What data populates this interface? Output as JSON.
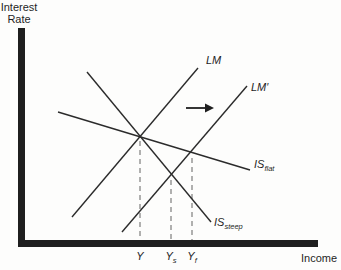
{
  "figure": {
    "background": "#fdfdfc",
    "ink_color": "#1f1f1f",
    "curve_color": "#2b2b2b",
    "guide_color": "#8f8f8f"
  },
  "labels": {
    "y_axis_line1": "Interest",
    "y_axis_line2": "Rate",
    "x_axis": "Income",
    "lm": "LM",
    "lm_prime": "LM′",
    "is_flat_main": "IS",
    "is_flat_sub": "flat",
    "is_steep_main": "IS",
    "is_steep_sub": "steep",
    "tick_y_main": "Y",
    "tick_y_sub": "",
    "tick_ys_main": "Y",
    "tick_ys_sub": "s",
    "tick_yf_main": "Y",
    "tick_yf_sub": "f"
  },
  "chart_data": {
    "type": "line",
    "xlabel": "Income",
    "ylabel": "Interest Rate",
    "axes_numeric": false,
    "grid": false,
    "axes_px": {
      "y_axis": {
        "x": 18,
        "y": 28,
        "w": 7,
        "h": 219
      },
      "x_axis": {
        "x": 18,
        "y": 240,
        "w": 300,
        "h": 7
      }
    },
    "series": [
      {
        "name": "lm",
        "label": "LM",
        "slope": "positive",
        "points_px": [
          [
            72,
            217
          ],
          [
            198,
            68
          ]
        ]
      },
      {
        "name": "lm-prime",
        "label": "LM′",
        "slope": "positive",
        "points_px": [
          [
            122,
            232
          ],
          [
            247,
            86
          ]
        ]
      },
      {
        "name": "is-flat",
        "label": "IS flat",
        "slope": "negative-shallow",
        "points_px": [
          [
            58,
            112
          ],
          [
            250,
            170
          ]
        ]
      },
      {
        "name": "is-steep",
        "label": "IS steep",
        "slope": "negative-steep",
        "points_px": [
          [
            87,
            72
          ],
          [
            211,
            222
          ]
        ]
      }
    ],
    "equilibria": [
      {
        "name": "y-initial",
        "label": "Y",
        "x_px": 140,
        "y_px": 138
      },
      {
        "name": "y-s",
        "label": "Ys",
        "x_px": 171,
        "y_px": 177
      },
      {
        "name": "y-f",
        "label": "Yf",
        "x_px": 192,
        "y_px": 155
      }
    ],
    "shift_arrow": {
      "from_px": [
        186,
        108
      ],
      "to_px": [
        214,
        108
      ],
      "direction": "right"
    }
  }
}
